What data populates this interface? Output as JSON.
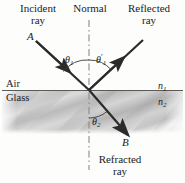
{
  "diagram": {
    "title_labels": {
      "incident": "Incident\nray",
      "incident_line1": "Incident",
      "incident_line2": "ray",
      "normal": "Normal",
      "reflected_line1": "Reflected",
      "reflected_line2": "ray",
      "refracted_line1": "Refracted",
      "refracted_line2": "ray"
    },
    "ray_points": {
      "incident_point": "A",
      "refracted_point": "B"
    },
    "angles": {
      "theta1": "θ1",
      "theta1_symbol": "θ",
      "theta1_sub": "1",
      "theta1_prime_symbol": "θ",
      "theta1_prime_sub": "1",
      "theta1_prime_mark": "′",
      "theta2_symbol": "θ",
      "theta2_sub": "2"
    },
    "media": {
      "upper_medium": "Air",
      "lower_medium": "Glass",
      "upper_index_symbol": "n",
      "upper_index_sub": "1",
      "lower_index_symbol": "n",
      "lower_index_sub": "2"
    },
    "colors": {
      "ray": "#2b2b2b",
      "interface": "#555555",
      "normal_dash": "#7a7a7a",
      "glass_light": "#d8d8d8",
      "glass_dark": "#a9a9a9",
      "text": "#1b1b1b"
    },
    "geometry": {
      "origin_x": 89,
      "origin_y": 90,
      "interface_y": 90,
      "normal_x": 89,
      "normal_top_y": 20,
      "normal_bottom_y": 170,
      "glass_top_y": 91,
      "glass_bottom_y": 134
    }
  }
}
